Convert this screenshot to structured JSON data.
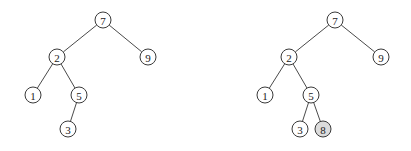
{
  "diagram": {
    "type": "binary-search-tree-insertion",
    "node_radius": 8,
    "colors": {
      "node_fill": "#ffffff",
      "highlight_fill": "#dcdcdc",
      "stroke": "#3a3a3a"
    },
    "trees": [
      {
        "name": "before",
        "nodes": [
          {
            "id": "a7",
            "label": "7",
            "x": 103,
            "y": 20,
            "highlight": false
          },
          {
            "id": "a2",
            "label": "2",
            "x": 57,
            "y": 57,
            "highlight": false
          },
          {
            "id": "a9",
            "label": "9",
            "x": 148,
            "y": 57,
            "highlight": false
          },
          {
            "id": "a1",
            "label": "1",
            "x": 33,
            "y": 95,
            "highlight": false
          },
          {
            "id": "a5",
            "label": "5",
            "x": 79,
            "y": 95,
            "highlight": false
          },
          {
            "id": "a3",
            "label": "3",
            "x": 68,
            "y": 129,
            "highlight": false
          }
        ],
        "edges": [
          [
            "a7",
            "a2"
          ],
          [
            "a7",
            "a9"
          ],
          [
            "a2",
            "a1"
          ],
          [
            "a2",
            "a5"
          ],
          [
            "a5",
            "a3"
          ]
        ]
      },
      {
        "name": "after",
        "nodes": [
          {
            "id": "b7",
            "label": "7",
            "x": 335,
            "y": 20,
            "highlight": false
          },
          {
            "id": "b2",
            "label": "2",
            "x": 289,
            "y": 57,
            "highlight": false
          },
          {
            "id": "b9",
            "label": "9",
            "x": 381,
            "y": 57,
            "highlight": false
          },
          {
            "id": "b1",
            "label": "1",
            "x": 265,
            "y": 95,
            "highlight": false
          },
          {
            "id": "b5",
            "label": "5",
            "x": 311,
            "y": 95,
            "highlight": false
          },
          {
            "id": "b3",
            "label": "3",
            "x": 300,
            "y": 129,
            "highlight": false
          },
          {
            "id": "b8",
            "label": "8",
            "x": 323,
            "y": 129,
            "highlight": true
          }
        ],
        "edges": [
          [
            "b7",
            "b2"
          ],
          [
            "b7",
            "b9"
          ],
          [
            "b2",
            "b1"
          ],
          [
            "b2",
            "b5"
          ],
          [
            "b5",
            "b3"
          ],
          [
            "b5",
            "b8"
          ]
        ]
      }
    ]
  }
}
